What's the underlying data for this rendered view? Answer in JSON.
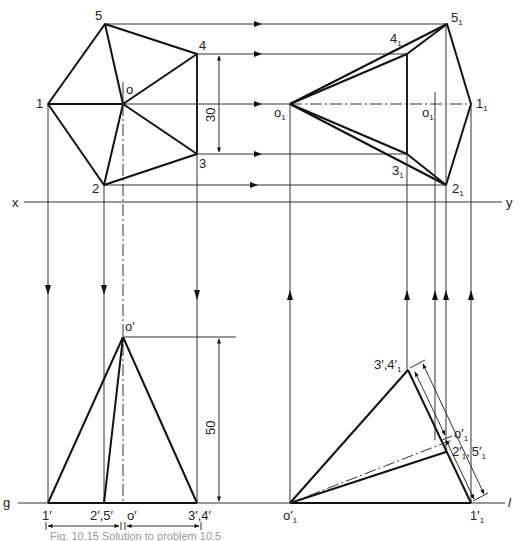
{
  "figure": {
    "caption": "Fig. 10.15 Solution to problem 10.5"
  },
  "labels": {
    "top_view": {
      "p1": "1",
      "p2": "2",
      "p3": "3",
      "p4": "4",
      "p5": "5",
      "o": "o",
      "dim_30": "30"
    },
    "aux_top_view": {
      "p1": "1",
      "p2": "2",
      "p3": "3",
      "p4": "4",
      "p5": "5",
      "o": "o",
      "o_inner": "o",
      "sub": "1"
    },
    "reference_line": {
      "x": "x",
      "y": "y"
    },
    "front_view": {
      "apex": "o′",
      "p1": "1′",
      "p25": "2′,5′",
      "o_base": "o′",
      "p34": "3′,4′",
      "dim_50": "50",
      "ground": "g"
    },
    "aux_front_view": {
      "apex": "o′",
      "p1": "1′",
      "p34": "3′,4′",
      "p25": "2′",
      "p25b": "5′",
      "axis_label": "o′",
      "sub": "1",
      "ground_line": "l"
    }
  },
  "colors": {
    "line": "#111111",
    "construction": "#333333",
    "text": "#222222",
    "background": "#ffffff"
  }
}
